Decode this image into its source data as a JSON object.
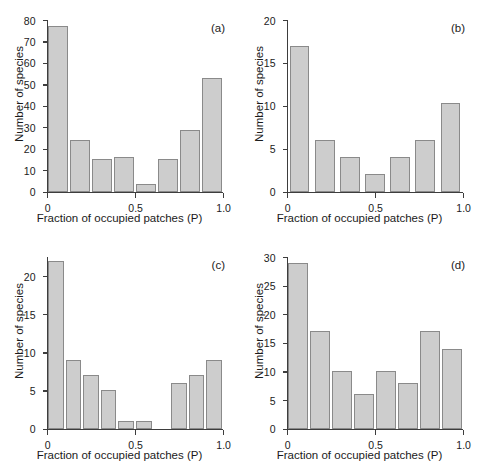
{
  "figure": {
    "panels_count": 4,
    "bar_fill_color": "#cdcdcd",
    "bar_edge_color": "#8a8a8a",
    "axis_color": "#3d3d3d",
    "background_color": "#ffffff"
  },
  "chart_data": [
    {
      "type": "bar",
      "panel_label": "(a)",
      "title": "",
      "xlabel": "Fraction of occupied patches (P)",
      "ylabel": "Number of species",
      "xlim": [
        0,
        1.0
      ],
      "ylim": [
        0,
        80
      ],
      "xticks": [
        0,
        0.5,
        1.0
      ],
      "xtick_labels": [
        "0",
        "0.5",
        "1.0"
      ],
      "yticks": [
        0,
        10,
        20,
        30,
        40,
        50,
        60,
        70,
        80
      ],
      "ytick_labels": [
        "0",
        "10",
        "20",
        "30",
        "40",
        "50",
        "60",
        "70",
        "80"
      ],
      "grid": false,
      "legend": "none",
      "bin_edges": [
        0.0,
        0.125,
        0.25,
        0.375,
        0.5,
        0.625,
        0.75,
        0.875,
        1.0
      ],
      "categories": [
        "0-0.125",
        "0.125-0.25",
        "0.25-0.375",
        "0.375-0.5",
        "0.5-0.625",
        "0.625-0.75",
        "0.75-0.875",
        "0.875-1.0"
      ],
      "values": [
        77,
        24,
        15,
        16,
        3.5,
        15,
        28.5,
        53
      ]
    },
    {
      "type": "bar",
      "panel_label": "(b)",
      "title": "",
      "xlabel": "Fraction of occupied patches (P)",
      "ylabel": "Number of species",
      "xlim": [
        0,
        1.0
      ],
      "ylim": [
        0,
        20
      ],
      "xticks": [
        0,
        0.5,
        1.0
      ],
      "xtick_labels": [
        "0",
        "0.5",
        "1.0"
      ],
      "yticks": [
        0,
        5,
        10,
        15,
        20
      ],
      "ytick_labels": [
        "0",
        "5",
        "10",
        "15",
        "20"
      ],
      "grid": false,
      "legend": "none",
      "bin_edges": [
        0.0,
        0.143,
        0.286,
        0.429,
        0.571,
        0.714,
        0.857,
        1.0
      ],
      "categories": [
        "0-0.14",
        "0.14-0.29",
        "0.29-0.43",
        "0.43-0.57",
        "0.57-0.71",
        "0.71-0.86",
        "0.86-1.0"
      ],
      "values": [
        17,
        6,
        4,
        2,
        4,
        6,
        10.3
      ]
    },
    {
      "type": "bar",
      "panel_label": "(c)",
      "title": "",
      "xlabel": "Fraction of occupied patches (P)",
      "ylabel": "Number of species",
      "xlim": [
        0,
        1.0
      ],
      "ylim": [
        0,
        22.5
      ],
      "xticks": [
        0,
        0.5,
        1.0
      ],
      "xtick_labels": [
        "0",
        "0.5",
        "1.0"
      ],
      "yticks": [
        0,
        5,
        10,
        15,
        20
      ],
      "ytick_labels": [
        "0",
        "5",
        "10",
        "15",
        "20"
      ],
      "grid": false,
      "legend": "none",
      "bin_edges": [
        0.0,
        0.125,
        0.25,
        0.375,
        0.5,
        0.625,
        0.75,
        0.875,
        1.0
      ],
      "categories": [
        "0-0.125",
        "0.125-0.25",
        "0.25-0.375",
        "0.375-0.5",
        "0.5-0.625",
        "0.625-0.75",
        "0.75-0.875",
        "0.875-1.0"
      ],
      "values": [
        22,
        9,
        7,
        5,
        1,
        1,
        0,
        6,
        7,
        9
      ]
    },
    {
      "type": "bar",
      "panel_label": "(d)",
      "title": "",
      "xlabel": "Fraction of occupied patches (P)",
      "ylabel": "Number of species",
      "xlim": [
        0,
        1.0
      ],
      "ylim": [
        0,
        30
      ],
      "xticks": [
        0,
        0.5,
        1.0
      ],
      "xtick_labels": [
        "0",
        "0.5",
        "1.0"
      ],
      "yticks": [
        0,
        5,
        10,
        15,
        20,
        25,
        30
      ],
      "ytick_labels": [
        "0",
        "5",
        "10",
        "15",
        "20",
        "25",
        "30"
      ],
      "grid": false,
      "legend": "none",
      "bin_edges": [
        0.0,
        0.125,
        0.25,
        0.375,
        0.5,
        0.625,
        0.75,
        0.875,
        1.0
      ],
      "categories": [
        "0-0.125",
        "0.125-0.25",
        "0.25-0.375",
        "0.375-0.5",
        "0.5-0.625",
        "0.625-0.75",
        "0.75-0.875",
        "0.875-1.0"
      ],
      "values": [
        29,
        17,
        10,
        6,
        10,
        8,
        17,
        14
      ]
    }
  ]
}
